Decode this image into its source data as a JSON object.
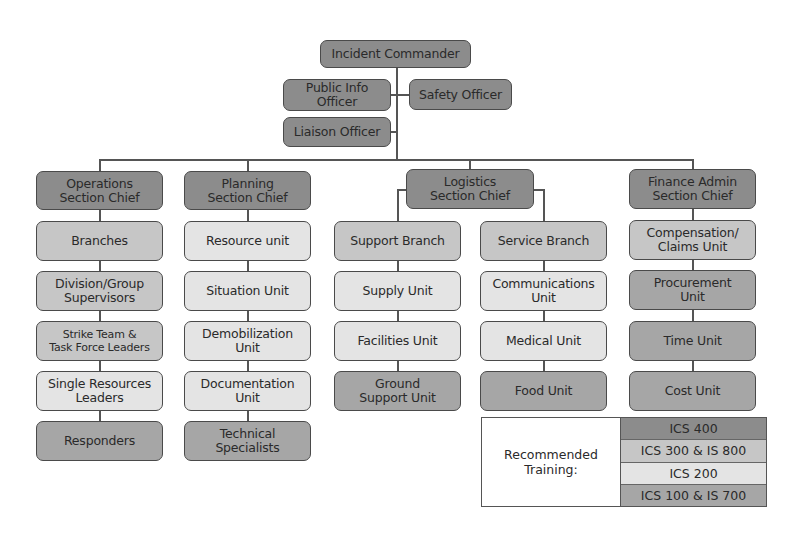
{
  "diagram": {
    "colors": {
      "ics_400": "#8c8c8c",
      "ics_300_is_800": "#c6c6c6",
      "ics_200": "#e4e4e4",
      "ics_100_is_700": "#a6a6a6",
      "line": "#555555"
    },
    "command": {
      "incident_commander": "Incident Commander",
      "public_info_officer": "Public Info\nOfficer",
      "safety_officer": "Safety Officer",
      "liaison_officer": "Liaison Officer"
    },
    "sections": {
      "operations": {
        "chief": "Operations\nSection Chief",
        "units": [
          "Branches",
          "Division/Group\nSupervisors",
          "Strike Team &\nTask Force Leaders",
          "Single Resources\nLeaders",
          "Responders"
        ]
      },
      "planning": {
        "chief": "Planning\nSection Chief",
        "units": [
          "Resource unit",
          "Situation Unit",
          "Demobilization\nUnit",
          "Documentation\nUnit",
          "Technical\nSpecialists"
        ]
      },
      "logistics": {
        "chief": "Logistics\nSection Chief",
        "support_branch": {
          "label": "Support Branch",
          "units": [
            "Supply Unit",
            "Facilities Unit",
            "Ground\nSupport Unit"
          ]
        },
        "service_branch": {
          "label": "Service Branch",
          "units": [
            "Communications\nUnit",
            "Medical Unit",
            "Food Unit"
          ]
        }
      },
      "finance": {
        "chief": "Finance Admin\nSection Chief",
        "units": [
          "Compensation/\nClaims Unit",
          "Procurement\nUnit",
          "Time Unit",
          "Cost Unit"
        ]
      }
    },
    "legend": {
      "label": "Recommended\nTraining:",
      "items": [
        "ICS 400",
        "ICS 300 & IS 800",
        "ICS 200",
        "ICS 100 & IS 700"
      ]
    }
  }
}
